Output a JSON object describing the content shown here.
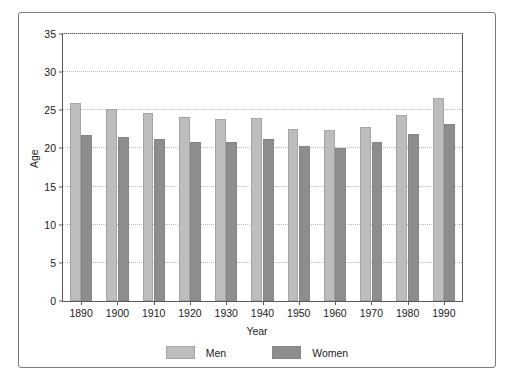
{
  "chart_data": {
    "type": "bar",
    "title": "",
    "xlabel": "Year",
    "ylabel": "Age",
    "categories": [
      "1890",
      "1900",
      "1910",
      "1920",
      "1930",
      "1940",
      "1950",
      "1960",
      "1970",
      "1980",
      "1990"
    ],
    "series": [
      {
        "name": "Men",
        "color": "#bdbdbd",
        "values": [
          25.9,
          25.2,
          24.6,
          24.1,
          23.9,
          24.0,
          22.5,
          22.4,
          22.8,
          24.4,
          26.6
        ]
      },
      {
        "name": "Women",
        "color": "#8d8d8d",
        "values": [
          21.8,
          21.5,
          21.2,
          20.9,
          20.9,
          21.2,
          20.3,
          20.0,
          20.8,
          21.9,
          23.2
        ]
      }
    ],
    "ylim": [
      0,
      35
    ],
    "yticks": [
      0,
      5,
      10,
      15,
      20,
      25,
      30,
      35
    ],
    "ytick_labels": [
      "0",
      "5",
      "10",
      "15",
      "20",
      "25",
      "30",
      "35"
    ],
    "grid": true,
    "grid_axis": "y",
    "grid_style": "dotted",
    "grid_color": "#b9b9c8",
    "legend_position": "bottom-center",
    "legend": [
      "Men",
      "Women"
    ],
    "frame": true,
    "background": "#ffffff"
  }
}
